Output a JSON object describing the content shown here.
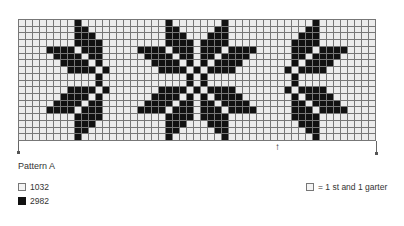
{
  "title": "Pattern A",
  "legend": [
    {
      "label": "1032",
      "color": "#ececec"
    },
    {
      "label": "2982",
      "color": "#111111"
    }
  ],
  "key": {
    "label": "= 1 st and 1 garter"
  },
  "grid": {
    "columns": 51,
    "rows": 18,
    "star_motif_rows": [
      [
        4,
        12
      ],
      [
        4,
        5,
        11,
        12
      ],
      [
        4,
        5,
        6,
        10,
        11,
        12
      ],
      [
        4,
        5,
        6,
        7,
        9,
        10,
        11,
        12
      ],
      [
        0,
        1,
        2,
        3,
        5,
        6,
        7,
        9,
        10,
        11,
        13,
        14,
        15,
        16
      ],
      [
        1,
        2,
        3,
        4,
        6,
        7,
        9,
        10,
        12,
        13,
        14,
        15
      ],
      [
        2,
        3,
        4,
        5,
        7,
        9,
        11,
        12,
        13,
        14
      ],
      [
        3,
        4,
        5,
        6,
        8,
        10,
        11,
        12,
        13
      ],
      [
        7,
        9
      ],
      [
        7,
        9
      ],
      [
        3,
        4,
        5,
        6,
        8,
        10,
        11,
        12,
        13
      ],
      [
        2,
        3,
        4,
        5,
        7,
        9,
        11,
        12,
        13,
        14
      ],
      [
        1,
        2,
        3,
        4,
        6,
        7,
        9,
        10,
        12,
        13,
        14,
        15
      ],
      [
        0,
        1,
        2,
        3,
        5,
        6,
        7,
        9,
        10,
        11,
        13,
        14,
        15,
        16
      ],
      [
        4,
        5,
        6,
        7,
        9,
        10,
        11,
        12
      ],
      [
        4,
        5,
        6,
        10,
        11,
        12
      ],
      [
        4,
        5,
        11,
        12
      ],
      [
        4,
        12
      ]
    ],
    "placements": [
      {
        "name": "left-half-star",
        "offset": 4,
        "rel_from": 0,
        "rel_to": 8
      },
      {
        "name": "center-star",
        "offset": 17,
        "rel_from": 0,
        "rel_to": 16
      },
      {
        "name": "right-half-star",
        "offset": 30,
        "rel_from": 8,
        "rel_to": 16
      }
    ]
  },
  "markers": {
    "arrow_symbol": "↑"
  }
}
